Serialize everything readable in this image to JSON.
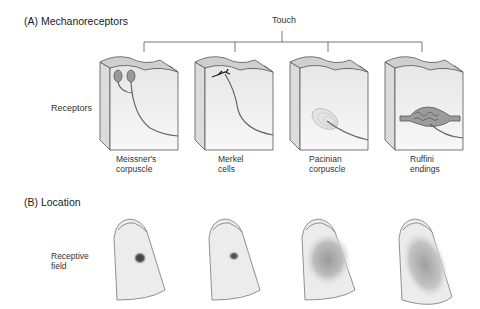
{
  "panel_a": {
    "title": "(A) Mechanoreceptors",
    "root_label": "Touch",
    "row_label": "Receptors",
    "receptors": [
      {
        "line1": "Meissner's",
        "line2": "corpuscle"
      },
      {
        "line1": "Merkel",
        "line2": "cells"
      },
      {
        "line1": "Pacinian",
        "line2": "corpuscle"
      },
      {
        "line1": "Ruffini",
        "line2": "endings"
      }
    ]
  },
  "panel_b": {
    "title": "(B) Location",
    "row_label_line1": "Receptive",
    "row_label_line2": "field"
  },
  "colors": {
    "line": "#555555",
    "skin_top": "#cfcfcf",
    "tissue": "#ececec",
    "finger": "#eeeeee",
    "field_dark": "#3a3a3a"
  }
}
